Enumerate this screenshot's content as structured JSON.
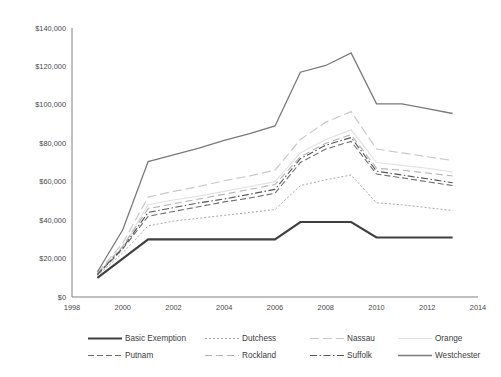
{
  "chart_data": {
    "type": "line",
    "title": "",
    "xlabel": "",
    "ylabel": "",
    "xlim": [
      1998,
      2014
    ],
    "ylim": [
      0,
      140000
    ],
    "grid": false,
    "legend_position": "bottom",
    "x_tick_labels": [
      "1998",
      "2000",
      "2002",
      "2004",
      "2006",
      "2008",
      "2010",
      "2012",
      "2014"
    ],
    "x_ticks": [
      1998,
      2000,
      2002,
      2004,
      2006,
      2008,
      2010,
      2012,
      2014
    ],
    "y_tick_labels": [
      "$0",
      "$20,000",
      "$40,000",
      "$60,000",
      "$80,000",
      "$100,000",
      "$120,000",
      "$140,000"
    ],
    "y_ticks": [
      0,
      20000,
      40000,
      60000,
      80000,
      100000,
      120000,
      140000
    ],
    "x": [
      1999,
      2000,
      2001,
      2002,
      2003,
      2004,
      2005,
      2006,
      2007,
      2008,
      2009,
      2010,
      2011,
      2012,
      2013
    ],
    "series": [
      {
        "name": "Basic Exemption",
        "color": "#3f3f3f",
        "width": 2.1,
        "dash": "none",
        "values": [
          10000,
          20000,
          30000,
          30000,
          30000,
          30000,
          30000,
          30000,
          39000,
          39000,
          39000,
          31000,
          31000,
          31000,
          31000
        ]
      },
      {
        "name": "Dutchess",
        "color": "#a8a8a8",
        "width": 1.0,
        "dash": "2,2",
        "values": [
          11000,
          23000,
          37000,
          39500,
          41000,
          42500,
          44000,
          45500,
          58000,
          61000,
          63500,
          49000,
          48000,
          46500,
          45000
        ]
      },
      {
        "name": "Nassau",
        "color": "#c9c9c9",
        "width": 1.2,
        "dash": "9,4",
        "values": [
          12500,
          28000,
          52000,
          55000,
          57500,
          60500,
          63000,
          66000,
          82000,
          91000,
          96500,
          77000,
          75000,
          73000,
          71000
        ]
      },
      {
        "name": "Orange",
        "color": "#e2e2e2",
        "width": 1.2,
        "dash": "none",
        "values": [
          12000,
          26000,
          48000,
          50500,
          52500,
          55000,
          57500,
          60000,
          75000,
          82000,
          87000,
          70000,
          68500,
          67000,
          65000
        ]
      },
      {
        "name": "Putnam",
        "color": "#6e6e6e",
        "width": 1.1,
        "dash": "6,3",
        "values": [
          11500,
          25000,
          42000,
          44500,
          47000,
          49500,
          51500,
          54000,
          70000,
          77000,
          81000,
          64000,
          62000,
          60000,
          58000
        ]
      },
      {
        "name": "Rockland",
        "color": "#b5b5b5",
        "width": 1.1,
        "dash": "7,4",
        "values": [
          12000,
          26500,
          46000,
          48500,
          51000,
          53500,
          56000,
          58500,
          73000,
          80000,
          84500,
          67000,
          66000,
          64500,
          63000
        ]
      },
      {
        "name": "Suffolk",
        "color": "#555555",
        "width": 1.1,
        "dash": "7,2.5,1.5,2.5",
        "values": [
          11800,
          25500,
          44000,
          46500,
          49000,
          51000,
          53500,
          56000,
          72000,
          79000,
          83000,
          65500,
          63500,
          61500,
          59500
        ]
      },
      {
        "name": "Westchester",
        "color": "#7a7a7a",
        "width": 1.3,
        "dash": "none",
        "values": [
          13000,
          35000,
          70500,
          74000,
          77500,
          81500,
          85000,
          89000,
          117000,
          120500,
          127000,
          100500,
          100500,
          98000,
          95500
        ]
      }
    ],
    "legend_rows": [
      [
        "Basic Exemption",
        "Dutchess",
        "Nassau",
        "Orange"
      ],
      [
        "Putnam",
        "Rockland",
        "Suffolk",
        "Westchester"
      ]
    ]
  }
}
